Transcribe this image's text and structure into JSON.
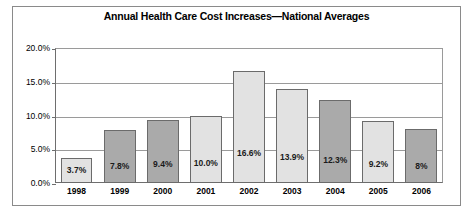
{
  "chart_data": {
    "type": "bar",
    "title": "Annual Health Care Cost Increases—National Averages",
    "xlabel": "",
    "ylabel": "",
    "categories": [
      "1998",
      "1999",
      "2000",
      "2001",
      "2002",
      "2003",
      "2004",
      "2005",
      "2006"
    ],
    "values": [
      3.7,
      7.8,
      9.4,
      10.0,
      16.6,
      13.9,
      12.3,
      9.2,
      8.0
    ],
    "data_labels": [
      "3.7%",
      "7.8%",
      "9.4%",
      "10.0%",
      "16.6%",
      "13.9%",
      "12.3%",
      "9.2%",
      "8%"
    ],
    "bar_shades": [
      "light",
      "dark",
      "dark",
      "light",
      "light",
      "light",
      "dark",
      "light",
      "dark"
    ],
    "ylim": [
      0,
      20
    ],
    "ytick_values": [
      0,
      5,
      10,
      15,
      20
    ],
    "ytick_labels": [
      "0.0%",
      "5.0%",
      "10.0%",
      "15.0%",
      "20.0%"
    ],
    "grid": true,
    "legend": false,
    "colors": {
      "bar_light": "#e2e2e2",
      "bar_dark": "#aaaaaa",
      "bar_border": "#6b6b6b",
      "gridline": "#9a9a9a",
      "axis": "#6e6e6e",
      "frame": "#8a8a8a",
      "text": "#000000",
      "background": "#ffffff"
    }
  }
}
